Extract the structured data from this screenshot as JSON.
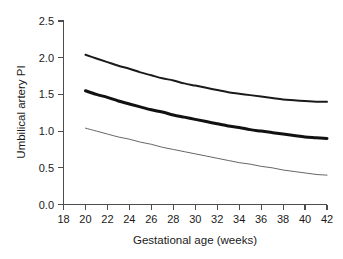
{
  "chart_data": {
    "type": "line",
    "title": "",
    "subtitle": "",
    "xlabel": "Gestational age (weeks)",
    "ylabel": "Umbilical artery PI",
    "xlim": [
      18,
      42
    ],
    "ylim": [
      0.0,
      2.5
    ],
    "xticks": [
      18,
      20,
      22,
      24,
      26,
      28,
      30,
      32,
      34,
      36,
      38,
      40,
      42
    ],
    "xtick_labels": [
      "18",
      "20",
      "22",
      "24",
      "26",
      "28",
      "30",
      "32",
      "34",
      "36",
      "38",
      "40",
      "42"
    ],
    "yticks": [
      0.0,
      0.5,
      1.0,
      1.5,
      2.0,
      2.5
    ],
    "ytick_labels": [
      "0.0",
      "0.5",
      "1.0",
      "1.5",
      "2.0",
      "2.5"
    ],
    "grid": false,
    "legend": "none",
    "x": [
      20,
      21,
      22,
      23,
      24,
      25,
      26,
      27,
      28,
      29,
      30,
      31,
      32,
      33,
      34,
      35,
      36,
      37,
      38,
      39,
      40,
      41,
      42
    ],
    "series": [
      {
        "name": "95th centile",
        "line_width": 2.0,
        "color": "#1a1a1a",
        "values": [
          2.04,
          1.99,
          1.94,
          1.89,
          1.85,
          1.8,
          1.76,
          1.72,
          1.69,
          1.65,
          1.62,
          1.59,
          1.56,
          1.53,
          1.51,
          1.49,
          1.47,
          1.45,
          1.43,
          1.42,
          1.41,
          1.4,
          1.4
        ]
      },
      {
        "name": "50th centile (median)",
        "line_width": 3.0,
        "color": "#111111",
        "values": [
          1.55,
          1.5,
          1.46,
          1.41,
          1.37,
          1.33,
          1.29,
          1.26,
          1.22,
          1.19,
          1.16,
          1.13,
          1.1,
          1.07,
          1.05,
          1.02,
          1.0,
          0.98,
          0.96,
          0.94,
          0.92,
          0.91,
          0.9
        ]
      },
      {
        "name": "5th centile",
        "line_width": 0.9,
        "color": "#555555",
        "values": [
          1.04,
          1.0,
          0.96,
          0.92,
          0.89,
          0.85,
          0.82,
          0.78,
          0.75,
          0.72,
          0.69,
          0.66,
          0.63,
          0.6,
          0.57,
          0.55,
          0.52,
          0.5,
          0.47,
          0.45,
          0.43,
          0.41,
          0.4
        ]
      }
    ]
  },
  "axes": {
    "axis_color": "#4d4d4d"
  }
}
